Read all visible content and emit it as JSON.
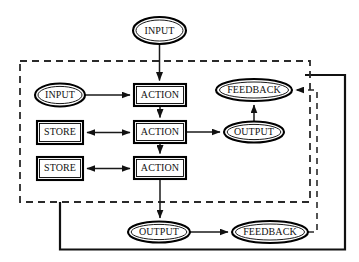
{
  "diagram": {
    "canvas": {
      "width": 359,
      "height": 262,
      "background": "#ffffff"
    },
    "colors": {
      "stroke": "#000000",
      "edge": "#1a1a1a",
      "boundary": "#2a2a2a",
      "fill": "#ffffff",
      "text": "#111111"
    },
    "nodes": [
      {
        "id": "input-top",
        "label": "INPUT",
        "shape": "ellipse",
        "cx": 159.5,
        "cy": 30.5,
        "rx": 26.5,
        "ry": 13.5
      },
      {
        "id": "input-left",
        "label": "INPUT",
        "shape": "ellipse",
        "cx": 60,
        "cy": 95,
        "rx": 25,
        "ry": 11.5
      },
      {
        "id": "action-1",
        "label": "ACTION",
        "shape": "rect",
        "x": 134,
        "y": 84,
        "w": 52,
        "h": 22
      },
      {
        "id": "action-2",
        "label": "ACTION",
        "shape": "rect",
        "x": 134,
        "y": 121,
        "w": 52,
        "h": 22
      },
      {
        "id": "action-3",
        "label": "ACTION",
        "shape": "rect",
        "x": 134,
        "y": 157,
        "w": 52,
        "h": 22
      },
      {
        "id": "store-1",
        "label": "STORE",
        "shape": "rect",
        "x": 37,
        "y": 121,
        "w": 46,
        "h": 23
      },
      {
        "id": "store-2",
        "label": "STORE",
        "shape": "rect",
        "x": 37,
        "y": 157,
        "w": 46,
        "h": 23
      },
      {
        "id": "output-mid",
        "label": "OUTPUT",
        "shape": "ellipse",
        "cx": 254,
        "cy": 132,
        "rx": 30,
        "ry": 10.5
      },
      {
        "id": "feedback-top",
        "label": "FEEDBACK",
        "shape": "ellipse",
        "cx": 254,
        "cy": 90,
        "rx": 38,
        "ry": 11
      },
      {
        "id": "output-bottom",
        "label": "OUTPUT",
        "shape": "ellipse",
        "cx": 159,
        "cy": 232,
        "rx": 31,
        "ry": 10.5
      },
      {
        "id": "feedback-bottom",
        "label": "FEEDBACK",
        "shape": "ellipse",
        "cx": 270,
        "cy": 232,
        "rx": 38,
        "ry": 11
      }
    ],
    "boundary": {
      "name": "system-boundary",
      "style": "dashed",
      "x": 20,
      "y": 61,
      "w": 290,
      "h": 141
    },
    "edges": [
      {
        "id": "e1",
        "from": "input-top",
        "to": "action-1",
        "style": "solid",
        "arrow": "end"
      },
      {
        "id": "e2",
        "from": "input-left",
        "to": "action-1",
        "style": "solid",
        "arrow": "end"
      },
      {
        "id": "e3",
        "from": "action-1",
        "to": "action-2",
        "style": "solid",
        "arrow": "end"
      },
      {
        "id": "e4",
        "from": "action-2",
        "to": "action-3",
        "style": "solid",
        "arrow": "end"
      },
      {
        "id": "e5",
        "from": "store-1",
        "to": "action-2",
        "style": "solid",
        "arrow": "both"
      },
      {
        "id": "e6",
        "from": "store-2",
        "to": "action-3",
        "style": "solid",
        "arrow": "both"
      },
      {
        "id": "e7",
        "from": "action-2",
        "to": "output-mid",
        "style": "solid",
        "arrow": "end"
      },
      {
        "id": "e8",
        "from": "output-mid",
        "to": "feedback-top",
        "style": "solid",
        "arrow": "end"
      },
      {
        "id": "e9",
        "from": "action-3",
        "to": "output-bottom",
        "style": "solid",
        "arrow": "end"
      },
      {
        "id": "e10",
        "from": "output-bottom",
        "to": "feedback-bottom",
        "style": "solid",
        "arrow": "end"
      },
      {
        "id": "e11",
        "from": "feedback-bottom",
        "to": "feedback-top",
        "style": "dashed",
        "arrow": "end"
      },
      {
        "id": "e12",
        "from": "boundary-bottom",
        "to": "outer-loop",
        "style": "solid",
        "arrow": "none"
      }
    ]
  }
}
